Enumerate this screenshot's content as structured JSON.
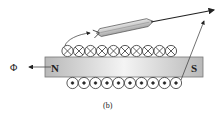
{
  "diagram": {
    "caption": "(b)",
    "flux_label": "Φ",
    "magnet": {
      "north_label": "N",
      "south_label": "S"
    },
    "coil": {
      "top_row_symbol": "cross",
      "top_row_count": 10,
      "bottom_row_symbol": "dot",
      "bottom_row_count": 10
    },
    "compass_needle": "pencil-shaped indicator pointing right-up",
    "colors": {
      "line": "#222222",
      "magnet_edge": "#7a7a7a",
      "magnet_fill_dark": "#bdbdbd",
      "magnet_fill_light": "#f2f2f2"
    }
  }
}
